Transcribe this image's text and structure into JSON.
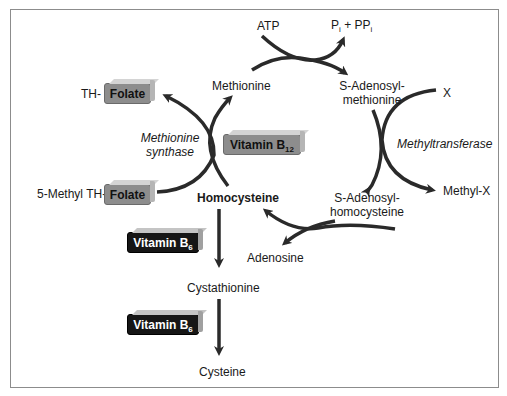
{
  "diagram": {
    "nodes": {
      "atp": "ATP",
      "pi_ppi": "Pi + PPi",
      "methionine": "Methionine",
      "sam_line1": "S-Adenosyl-",
      "sam_line2": "methionine",
      "x": "X",
      "methyl_x": "Methyl-X",
      "sah_line1": "S-Adenosyl-",
      "sah_line2": "homocysteine",
      "adenosine": "Adenosine",
      "homocysteine": "Homocysteine",
      "cystathionine": "Cystathionine",
      "cysteine": "Cysteine",
      "th_prefix": "TH-",
      "methyl_th_prefix": "5-Methyl TH-"
    },
    "enzymes": {
      "methionine_synthase_line1": "Methionine",
      "methionine_synthase_line2": "synthase",
      "methyltransferase": "Methyltransferase"
    },
    "cofactors": {
      "folate_top": "Folate",
      "folate_bottom": "Folate",
      "b12_main": "Vitamin B",
      "b12_sub": "12",
      "b6_upper_main": "Vitamin B",
      "b6_upper_sub": "6",
      "b6_lower_main": "Vitamin B",
      "b6_lower_sub": "6"
    },
    "colors": {
      "arrow": "#2a2a2a",
      "gray_box": "#8d8d8d",
      "dark_box": "#161616",
      "frame": "#8c8c8c"
    }
  }
}
